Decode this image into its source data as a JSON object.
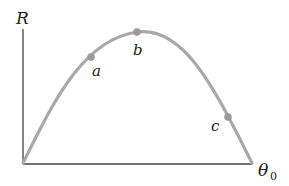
{
  "axes": {
    "y_label": "R",
    "x_label": "θ",
    "x_label_subscript": "0"
  },
  "points": [
    {
      "label": "a",
      "x": 91,
      "y": 57
    },
    {
      "label": "b",
      "x": 137,
      "y": 32
    },
    {
      "label": "c",
      "x": 227,
      "y": 117
    }
  ],
  "colors": {
    "curve": "#a8a8a8",
    "point": "#9a9a9a",
    "axis": "#444444"
  }
}
